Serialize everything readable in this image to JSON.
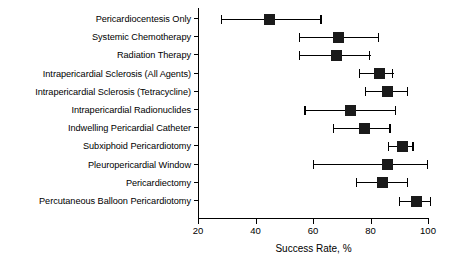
{
  "chart_data": {
    "type": "scatter",
    "title": "",
    "xlabel": "Success Rate, %",
    "ylabel": "",
    "xlim": [
      20,
      100
    ],
    "xticks": [
      20,
      40,
      60,
      80,
      100
    ],
    "xtick_labels": [
      "20",
      "40",
      "60",
      "80",
      "100"
    ],
    "grid": false,
    "legend": null,
    "orientation": "horizontal",
    "error_bars": "confidence-interval",
    "categories": [
      "Pericardiocentesis Only",
      "Systemic Chemotherapy",
      "Radiation Therapy",
      "Intrapericardial Sclerosis (All Agents)",
      "Intrapericardial Sclerosis (Tetracycline)",
      "Intrapericardial Radionuclides",
      "Indwelling Pericardial Catheter",
      "Subxiphoid Pericardiotomy",
      "Pleuropericardial Window",
      "Pericardiectomy",
      "Percutaneous Balloon Pericardiotomy"
    ],
    "values": [
      45,
      69,
      68,
      83,
      86,
      73,
      78,
      91,
      86,
      84,
      96
    ],
    "ci_low": [
      28,
      55,
      55,
      76,
      78,
      57,
      67,
      86,
      60,
      75,
      90
    ],
    "ci_high": [
      63,
      83,
      80,
      88,
      93,
      89,
      87,
      95,
      100,
      93,
      101
    ],
    "points": [
      {
        "label": "Pericardiocentesis Only",
        "value": 45,
        "low": 28,
        "high": 63
      },
      {
        "label": "Systemic Chemotherapy",
        "value": 69,
        "low": 55,
        "high": 83
      },
      {
        "label": "Radiation Therapy",
        "value": 68,
        "low": 55,
        "high": 80
      },
      {
        "label": "Intrapericardial Sclerosis (All Agents)",
        "value": 83,
        "low": 76,
        "high": 88
      },
      {
        "label": "Intrapericardial Sclerosis (Tetracycline)",
        "value": 86,
        "low": 78,
        "high": 93
      },
      {
        "label": "Intrapericardial Radionuclides",
        "value": 73,
        "low": 57,
        "high": 89
      },
      {
        "label": "Indwelling Pericardial Catheter",
        "value": 78,
        "low": 67,
        "high": 87
      },
      {
        "label": "Subxiphoid Pericardiotomy",
        "value": 91,
        "low": 86,
        "high": 95
      },
      {
        "label": "Pleuropericardial Window",
        "value": 86,
        "low": 60,
        "high": 100
      },
      {
        "label": "Pericardiectomy",
        "value": 84,
        "low": 75,
        "high": 93
      },
      {
        "label": "Percutaneous Balloon Pericardiotomy",
        "value": 96,
        "low": 90,
        "high": 101
      }
    ],
    "marker_color": "#1a1a1a",
    "axis_color": "#000000",
    "background_color": "#ffffff"
  }
}
